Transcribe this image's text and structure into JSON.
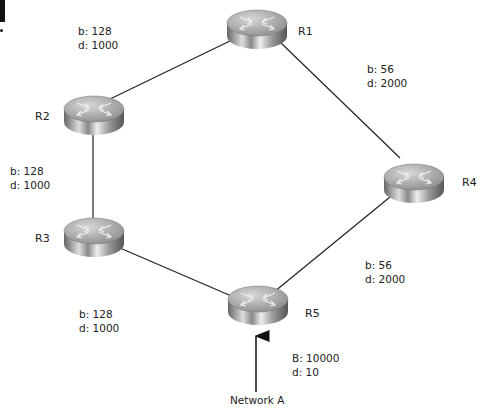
{
  "routers": [
    {
      "id": "R1",
      "label": "R1",
      "x": 226,
      "y": 8
    },
    {
      "id": "R2",
      "label": "R2",
      "x": 63,
      "y": 94
    },
    {
      "id": "R3",
      "label": "R3",
      "x": 63,
      "y": 216
    },
    {
      "id": "R4",
      "label": "R4",
      "x": 383,
      "y": 162
    },
    {
      "id": "R5",
      "label": "R5",
      "x": 227,
      "y": 284
    }
  ],
  "links": [
    {
      "from": "R2",
      "to": "R1",
      "b": "b: 128",
      "d": "d: 1000"
    },
    {
      "from": "R1",
      "to": "R4",
      "b": "b: 56",
      "d": "d: 2000"
    },
    {
      "from": "R2",
      "to": "R3",
      "b": "b: 128",
      "d": "d: 1000"
    },
    {
      "from": "R3",
      "to": "R5",
      "b": "b: 128",
      "d": "d: 1000"
    },
    {
      "from": "R5",
      "to": "R4",
      "b": "b: 56",
      "d": "d: 2000"
    }
  ],
  "network_a": {
    "label": "Network A",
    "b": "B: 10000",
    "d": "d: 10"
  }
}
